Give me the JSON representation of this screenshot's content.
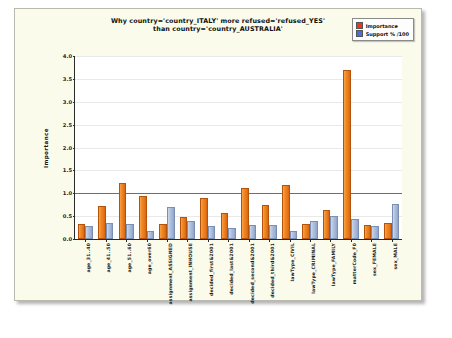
{
  "chart_data": {
    "type": "bar",
    "title_line1": "Why country='country_ITALY' more refused='refused_YES'",
    "title_line2": "than country='country_AUSTRALIA'",
    "xlabel": "",
    "ylabel": "Importance",
    "ylim": [
      0.0,
      4.0
    ],
    "ytick_labels": [
      "0.0",
      "0.5",
      "1.0",
      "1.5",
      "2.0",
      "2.5",
      "3.0",
      "3.5",
      "4.0"
    ],
    "ytick_values": [
      0.0,
      0.5,
      1.0,
      1.5,
      2.0,
      2.5,
      3.0,
      3.5,
      4.0
    ],
    "grid": true,
    "reference_line": 1.0,
    "legend_position": "top-right",
    "categories": [
      "age_31..40",
      "age_41..50",
      "age_51..60",
      "age_over60",
      "assignment_ASSIGNED",
      "assignment_INHOUSE",
      "decided_first&2001",
      "decided_last&2001",
      "decided_second&2001",
      "decided_third&2001",
      "lawType_CIVIL",
      "lawType_CRIMINAL",
      "lawType_FAMILY",
      "matterCode_F0",
      "sex_FEMALE",
      "sex_MALE"
    ],
    "series": [
      {
        "name": "Importance",
        "color": "#ef8a1f",
        "values": [
          0.28,
          0.68,
          1.17,
          0.89,
          0.28,
          0.44,
          0.86,
          0.52,
          1.07,
          0.7,
          1.14,
          0.28,
          0.58,
          3.66,
          0.27,
          0.31
        ]
      },
      {
        "name": "Support % /100",
        "color": "#a9bbd8",
        "values": [
          0.24,
          0.31,
          0.29,
          0.14,
          0.66,
          0.34,
          0.24,
          0.19,
          0.26,
          0.27,
          0.13,
          0.35,
          0.47,
          0.39,
          0.23,
          0.72
        ]
      }
    ]
  },
  "legend": {
    "items": [
      {
        "label": "Importance",
        "swatch": "#e23a1e"
      },
      {
        "label": "Support % /100",
        "swatch": "#4a6fd0"
      }
    ]
  }
}
